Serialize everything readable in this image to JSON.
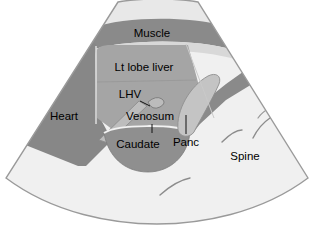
{
  "figure": {
    "kind": "ultrasound-sector-schematic",
    "background_color": "#ffffff",
    "sector_fill": "#f0f0f0",
    "outline_color": "#9a9a9a"
  },
  "palette": {
    "near_field": "#e8e8e8",
    "muscle": "#8a8a8a",
    "heart": "#878787",
    "liver": "#a5a5a5",
    "caudate": "#8f8f8f",
    "vessel_light": "#c9c9c9",
    "vessel_dark": "#8a8a8a",
    "pancreas": "#c4c4c4",
    "background": "#f0f0f0",
    "shadow_line": "#8c8c8c",
    "text": "#000000"
  },
  "labels": [
    {
      "id": "muscle",
      "text": "Muscle",
      "x": 152,
      "y": 34,
      "leader": false
    },
    {
      "id": "liver",
      "text": "Lt lobe liver",
      "x": 144,
      "y": 68,
      "leader": false
    },
    {
      "id": "lhv",
      "text": "LHV",
      "x": 130,
      "y": 96,
      "leader": true
    },
    {
      "id": "venosum",
      "text": "Venosum",
      "x": 150,
      "y": 118,
      "leader": true
    },
    {
      "id": "heart",
      "text": "Heart",
      "x": 64,
      "y": 117,
      "leader": false
    },
    {
      "id": "caudate",
      "text": "Caudate",
      "x": 138,
      "y": 144,
      "leader": false
    },
    {
      "id": "panc",
      "text": "Panc",
      "x": 186,
      "y": 141,
      "leader": true
    },
    {
      "id": "spine",
      "text": "Spine",
      "x": 245,
      "y": 157,
      "leader": false
    }
  ],
  "structures": [
    {
      "id": "near-field-band",
      "name": "near field skin band",
      "tone": "near_field"
    },
    {
      "id": "muscle-band",
      "name": "abdominal muscle band",
      "tone": "muscle"
    },
    {
      "id": "heart-wedge",
      "name": "heart",
      "tone": "heart"
    },
    {
      "id": "liver-region",
      "name": "left lobe of liver",
      "tone": "liver"
    },
    {
      "id": "lhv-vessel",
      "name": "left hepatic vein",
      "tone": "vessel_light"
    },
    {
      "id": "venosum-vessel",
      "name": "ligamentum venosum",
      "tone": "vessel_light"
    },
    {
      "id": "caudate-lobe",
      "name": "caudate lobe",
      "tone": "caudate"
    },
    {
      "id": "pancreas-body",
      "name": "pancreas",
      "tone": "pancreas"
    },
    {
      "id": "vessel-band",
      "name": "vascular band",
      "tone": "vessel_dark"
    },
    {
      "id": "spine-shadow-1",
      "name": "spine acoustic shadow",
      "tone": "shadow_line"
    },
    {
      "id": "spine-shadow-2",
      "name": "spine acoustic shadow",
      "tone": "shadow_line"
    },
    {
      "id": "spine-shadow-3",
      "name": "deep acoustic shadow",
      "tone": "shadow_line"
    },
    {
      "id": "deep-shadow",
      "name": "far field shadow",
      "tone": "shadow_line"
    }
  ]
}
